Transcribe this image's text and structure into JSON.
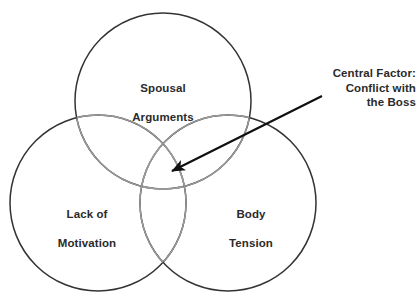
{
  "diagram": {
    "type": "venn",
    "title": "",
    "colors": {
      "circle_stroke_dark": "#333333",
      "circle_stroke_light": "#9a9a9a",
      "text": "#2b2b2b",
      "arrow": "#111111",
      "background": "#ffffff"
    },
    "circles": [
      {
        "id": "spousal-arguments",
        "label": "Spousal\nArguments",
        "label_line_1": "Spousal",
        "label_line_2": "Arguments",
        "cx": 163,
        "cy": 101,
        "r": 88,
        "position": "top"
      },
      {
        "id": "lack-of-motivation",
        "label": "Lack of\nMotivation",
        "label_line_1": "Lack of",
        "label_line_2": "Motivation",
        "cx": 98,
        "cy": 203,
        "r": 88,
        "position": "bottom-left"
      },
      {
        "id": "body-tension",
        "label": "Body\nTension",
        "label_line_1": "Body",
        "label_line_2": "Tension",
        "cx": 228,
        "cy": 203,
        "r": 88,
        "position": "bottom-right"
      }
    ],
    "annotation": {
      "id": "central-factor",
      "line_1": "Central Factor:",
      "line_2": "Conflict with",
      "line_3": "the Boss",
      "arrow": {
        "from_x": 322,
        "from_y": 96,
        "to_x": 167,
        "to_y": 174,
        "points_to": "central-triple-overlap"
      }
    }
  }
}
